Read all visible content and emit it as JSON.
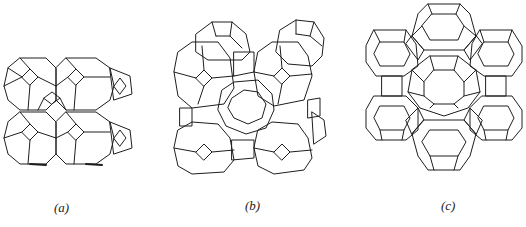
{
  "figure": {
    "panels": [
      {
        "id": "a",
        "label": "(a)",
        "description": "sodalite cages linked via double 4-rings (LTA-type framework)"
      },
      {
        "id": "b",
        "label": "(b)",
        "description": "sodalite cages linked via double 4-rings, 3D view"
      },
      {
        "id": "c",
        "label": "(c)",
        "description": "sodalite cages linked via double 6-rings around a supercage (FAU-type framework)"
      }
    ]
  }
}
